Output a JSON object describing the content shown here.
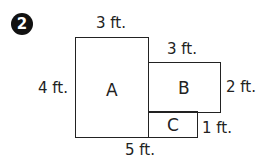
{
  "problem_number": "2",
  "shapes": [
    {
      "name": "A",
      "x": 75,
      "y": 37,
      "w": 74,
      "h": 101
    },
    {
      "name": "B",
      "x": 148,
      "y": 62,
      "w": 73,
      "h": 51
    },
    {
      "name": "C",
      "x": 148,
      "y": 112,
      "w": 50,
      "h": 26
    }
  ],
  "dimensions": {
    "a_top": "3 ft.",
    "a_left": "4 ft.",
    "b_top": "3 ft.",
    "b_right": "2 ft.",
    "c_right": "1 ft.",
    "bottom": "5 ft."
  }
}
